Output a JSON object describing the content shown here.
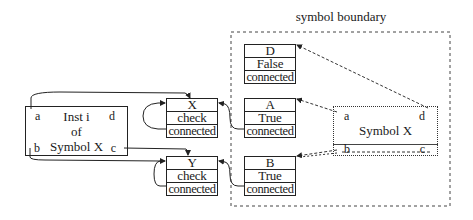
{
  "title": "symbol boundary",
  "instance": {
    "lines": [
      "Inst i",
      "of",
      "Symbol X"
    ],
    "pins": {
      "a": "a",
      "b": "b",
      "c": "c",
      "d": "d"
    }
  },
  "symbol": {
    "label": "Symbol X",
    "pins": {
      "a": "a",
      "b": "b",
      "c": "c",
      "d": "d"
    }
  },
  "records": {
    "X": {
      "name": "X",
      "value": "check",
      "status": "connected"
    },
    "Y": {
      "name": "Y",
      "value": "check",
      "status": "connected"
    },
    "D": {
      "name": "D",
      "value": "False",
      "status": "connected"
    },
    "A": {
      "name": "A",
      "value": "True",
      "status": "connected"
    },
    "B": {
      "name": "B",
      "value": "True",
      "status": "connected"
    }
  },
  "colors": {
    "line": "#222222",
    "background": "#ffffff"
  }
}
